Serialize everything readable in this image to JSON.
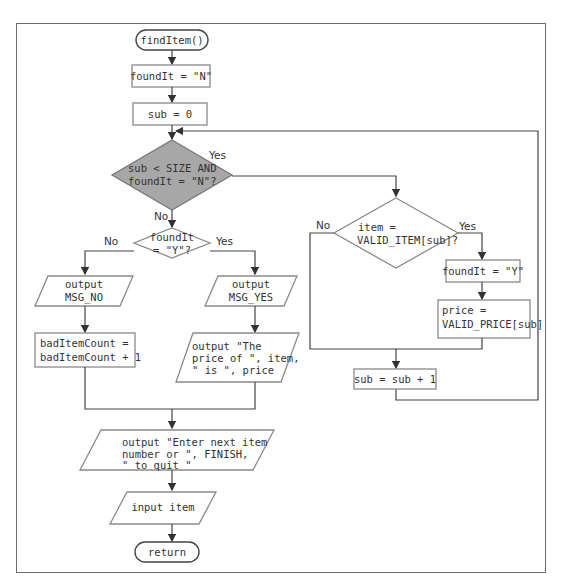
{
  "diagram": {
    "start": "findItem()",
    "init_found": "foundIt = \"N\"",
    "init_sub": "sub = 0",
    "loop_decision": [
      "sub < SIZE AND",
      "foundIt = \"N\"?"
    ],
    "loop_yes": "Yes",
    "loop_no": "No",
    "match_decision": [
      "item =",
      "VALID_ITEM[sub]?"
    ],
    "match_yes": "Yes",
    "match_no": "No",
    "set_found": "foundIt = \"Y\"",
    "set_price": [
      "price =",
      "VALID_PRICE[sub]"
    ],
    "increment": "sub = sub + 1",
    "found_decision": [
      "foundIt",
      "= \"Y\"?"
    ],
    "found_yes": "Yes",
    "found_no": "No",
    "output_no": [
      "output",
      "MSG_NO"
    ],
    "output_yes": [
      "output",
      "MSG_YES"
    ],
    "bad_count": [
      "badItemCount =",
      "badItemCount + 1"
    ],
    "output_price": [
      "output \"The",
      "price of \", item,",
      "\" is \", price"
    ],
    "output_prompt": [
      "output \"Enter next item",
      "number or \", FINISH,",
      "\" to quit \""
    ],
    "input": "input item",
    "end": "return"
  }
}
